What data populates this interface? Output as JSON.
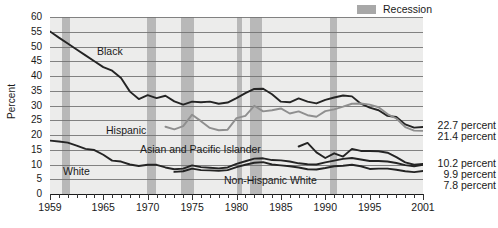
{
  "legend": {
    "recession_label": "Recession",
    "recession_color": "#b3b3b3"
  },
  "axes": {
    "ylabel": "Percent",
    "yticks": [
      "0",
      "5",
      "10",
      "15",
      "20",
      "25",
      "30",
      "35",
      "40",
      "45",
      "50",
      "55",
      "60"
    ],
    "xticks": [
      "1959",
      "1965",
      "1970",
      "1975",
      "1980",
      "1985",
      "1990",
      "1995",
      "2001"
    ]
  },
  "annotations": {
    "black": "Black",
    "hispanic": "Hispanic",
    "asian": "Asian and Pacific Islander",
    "white": "White",
    "nhwhite": "Non-Hispanic White"
  },
  "end_labels": {
    "black": "22.7 percent",
    "hispanic": "21.4 percent",
    "asian": "10.2 percent",
    "white": "9.9 percent",
    "nhwhite": "7.8 percent"
  },
  "chart_data": {
    "type": "line",
    "title": "",
    "xlabel": "",
    "ylabel": "Percent",
    "xlim": [
      1959,
      2001
    ],
    "ylim": [
      0,
      60
    ],
    "ystep": 5,
    "grid": true,
    "legend_position": "top-right",
    "xticks": [
      1959,
      1965,
      1970,
      1975,
      1980,
      1985,
      1990,
      1995,
      2001
    ],
    "recession_bands": [
      [
        1960.3,
        1961.2
      ],
      [
        1969.9,
        1970.9
      ],
      [
        1973.8,
        1975.2
      ],
      [
        1980.0,
        1980.6
      ],
      [
        1981.5,
        1982.9
      ],
      [
        1990.5,
        1991.3
      ],
      [
        2001.2,
        2001.9
      ]
    ],
    "series": [
      {
        "name": "Black",
        "color": "#242424",
        "end_value": 22.7,
        "x": [
          1959,
          1960,
          1961,
          1962,
          1963,
          1964,
          1965,
          1966,
          1967,
          1968,
          1969,
          1970,
          1971,
          1972,
          1973,
          1974,
          1975,
          1976,
          1977,
          1978,
          1979,
          1980,
          1981,
          1982,
          1983,
          1984,
          1985,
          1986,
          1987,
          1988,
          1989,
          1990,
          1991,
          1992,
          1993,
          1994,
          1995,
          1996,
          1997,
          1998,
          1999,
          2000,
          2001
        ],
        "values": [
          55.1,
          53.0,
          51.0,
          49.0,
          47.0,
          45.0,
          43.0,
          41.8,
          39.3,
          34.7,
          32.2,
          33.5,
          32.5,
          33.3,
          31.4,
          30.3,
          31.3,
          31.1,
          31.3,
          30.6,
          31.0,
          32.5,
          34.2,
          35.6,
          35.7,
          33.8,
          31.3,
          31.1,
          32.4,
          31.3,
          30.7,
          31.9,
          32.7,
          33.4,
          33.1,
          30.6,
          29.3,
          28.4,
          26.5,
          26.1,
          23.6,
          22.5,
          22.7
        ]
      },
      {
        "name": "Hispanic",
        "color": "#8f8f8f",
        "end_value": 21.4,
        "x": [
          1972,
          1973,
          1974,
          1975,
          1976,
          1977,
          1978,
          1979,
          1980,
          1981,
          1982,
          1983,
          1984,
          1985,
          1986,
          1987,
          1988,
          1989,
          1990,
          1991,
          1992,
          1993,
          1994,
          1995,
          1996,
          1997,
          1998,
          1999,
          2000,
          2001
        ],
        "values": [
          22.8,
          21.9,
          23.0,
          26.9,
          24.7,
          22.4,
          21.6,
          21.8,
          25.7,
          26.5,
          29.9,
          28.0,
          28.4,
          29.0,
          27.3,
          28.0,
          26.7,
          26.2,
          28.1,
          28.7,
          29.6,
          30.6,
          30.7,
          30.3,
          29.4,
          27.1,
          25.6,
          22.7,
          21.5,
          21.4
        ]
      },
      {
        "name": "Asian and Pacific Islander",
        "color": "#242424",
        "end_value": 10.2,
        "x": [
          1987,
          1988,
          1989,
          1990,
          1991,
          1992,
          1993,
          1994,
          1995,
          1996,
          1997,
          1998,
          1999,
          2000,
          2001
        ],
        "values": [
          16.1,
          17.3,
          14.1,
          12.2,
          13.8,
          12.7,
          15.3,
          14.6,
          14.6,
          14.5,
          14.0,
          12.5,
          10.7,
          9.9,
          10.2
        ]
      },
      {
        "name": "White",
        "color": "#242424",
        "end_value": 9.9,
        "x": [
          1959,
          1960,
          1961,
          1962,
          1963,
          1964,
          1965,
          1966,
          1967,
          1968,
          1969,
          1970,
          1971,
          1972,
          1973,
          1974,
          1975,
          1976,
          1977,
          1978,
          1979,
          1980,
          1981,
          1982,
          1983,
          1984,
          1985,
          1986,
          1987,
          1988,
          1989,
          1990,
          1991,
          1992,
          1993,
          1994,
          1995,
          1996,
          1997,
          1998,
          1999,
          2000,
          2001
        ],
        "values": [
          18.1,
          17.8,
          17.4,
          16.4,
          15.3,
          14.9,
          13.3,
          11.3,
          11.0,
          10.0,
          9.5,
          9.9,
          9.9,
          9.0,
          8.4,
          8.6,
          9.7,
          9.1,
          8.9,
          8.7,
          9.0,
          10.2,
          11.1,
          12.0,
          12.1,
          11.5,
          11.4,
          11.0,
          10.4,
          10.1,
          10.0,
          10.7,
          11.3,
          11.9,
          12.2,
          11.7,
          11.2,
          11.2,
          11.0,
          10.5,
          9.8,
          9.4,
          9.9
        ]
      },
      {
        "name": "Non-Hispanic White",
        "color": "#242424",
        "end_value": 7.8,
        "x": [
          1973,
          1974,
          1975,
          1976,
          1977,
          1978,
          1979,
          1980,
          1981,
          1982,
          1983,
          1984,
          1985,
          1986,
          1987,
          1988,
          1989,
          1990,
          1991,
          1992,
          1993,
          1994,
          1995,
          1996,
          1997,
          1998,
          1999,
          2000,
          2001
        ],
        "values": [
          7.5,
          7.7,
          8.6,
          8.1,
          8.0,
          7.9,
          8.1,
          9.1,
          9.9,
          10.6,
          10.8,
          10.0,
          9.7,
          9.4,
          9.0,
          8.4,
          8.3,
          8.8,
          9.4,
          9.6,
          9.9,
          9.4,
          8.5,
          8.6,
          8.6,
          8.2,
          7.7,
          7.4,
          7.8
        ]
      }
    ]
  }
}
